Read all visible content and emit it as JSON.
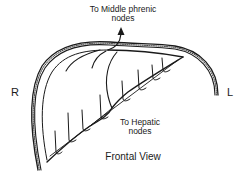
{
  "figure": {
    "view_label": "Frontal View",
    "side_labels": {
      "right": "R",
      "left": "L"
    },
    "annotations": {
      "phrenic": {
        "line1": "To Middle phrenic",
        "line2": "nodes"
      },
      "hepatic": {
        "line1": "To Hepatic",
        "line2": "nodes"
      }
    },
    "colors": {
      "ink": "#1a1a1a",
      "background": "#ffffff"
    }
  }
}
